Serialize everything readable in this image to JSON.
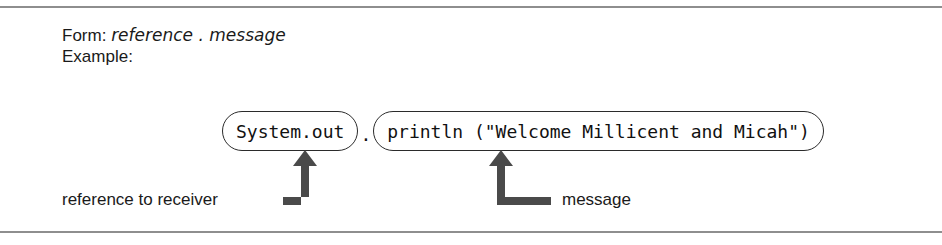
{
  "figure": {
    "title_lines": {
      "form_label": "Form:",
      "form_value": "reference . message",
      "example_label": "Example:"
    },
    "code": {
      "receiver": "System.out",
      "separator": ".",
      "message_call": "println (\"Welcome Millicent and Micah\")"
    },
    "annotations": {
      "left_label": "reference to receiver",
      "right_label": "message",
      "left_arrow_icon": "arrow-up-elbow-icon",
      "right_arrow_icon": "arrow-up-elbow-icon"
    },
    "rules": {
      "top_icon": "horizontal-rule",
      "bottom_icon": "horizontal-rule"
    },
    "colors": {
      "text": "#1a1a1a",
      "rule": "#8e8e8e",
      "arrow": "#4a4a4a",
      "pill_border": "#2b2b2b",
      "background": "#ffffff"
    }
  }
}
